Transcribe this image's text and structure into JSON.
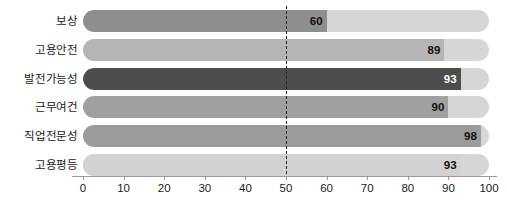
{
  "chart_data": {
    "type": "bar",
    "orientation": "horizontal",
    "title": "",
    "xlabel": "",
    "ylabel": "",
    "xlim": [
      0,
      100
    ],
    "xticks": [
      0,
      10,
      20,
      30,
      40,
      50,
      60,
      70,
      80,
      90,
      100
    ],
    "xtick_labels": [
      "0",
      "10",
      "20",
      "30",
      "40",
      "50",
      "60",
      "70",
      "80",
      "90",
      "100"
    ],
    "grid": false,
    "legend": null,
    "categories": [
      "보상",
      "고용안전",
      "발전가능성",
      "근무여건",
      "직업전문성",
      "고용평등"
    ],
    "values": [
      60,
      89,
      93,
      90,
      98,
      93
    ],
    "bar_colors": [
      "#8e8e8e",
      "#b5b5b5",
      "#4d4d4d",
      "#a0a0a0",
      "#9b9b9b",
      "#d2d2d2"
    ],
    "track_color": "#d6d6d6",
    "reference_line": {
      "value": 50,
      "style": "dashed",
      "color": "#222222"
    },
    "bars": [
      {
        "label": "보상",
        "value": 60,
        "value_text": "60",
        "color": "#8e8e8e"
      },
      {
        "label": "고용안전",
        "value": 89,
        "value_text": "89",
        "color": "#b5b5b5"
      },
      {
        "label": "발전가능성",
        "value": 93,
        "value_text": "93",
        "color": "#4d4d4d"
      },
      {
        "label": "근무여건",
        "value": 90,
        "value_text": "90",
        "color": "#a0a0a0"
      },
      {
        "label": "직업전문성",
        "value": 98,
        "value_text": "98",
        "color": "#9b9b9b"
      },
      {
        "label": "고용평등",
        "value": 93,
        "value_text": "93",
        "color": "#d2d2d2"
      }
    ]
  }
}
